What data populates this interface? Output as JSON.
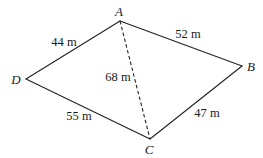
{
  "diagram": {
    "type": "quadrilateral",
    "vertices": [
      {
        "id": "A",
        "label": "A",
        "x": 120,
        "y": 21,
        "label_x": 119,
        "label_y": 16
      },
      {
        "id": "B",
        "label": "B",
        "x": 242,
        "y": 66,
        "label_x": 251,
        "label_y": 71
      },
      {
        "id": "C",
        "label": "C",
        "x": 150,
        "y": 139,
        "label_x": 149,
        "label_y": 154
      },
      {
        "id": "D",
        "label": "D",
        "x": 26,
        "y": 79,
        "label_x": 16,
        "label_y": 84
      }
    ],
    "edges": [
      {
        "from": "D",
        "to": "A",
        "label": "44 m",
        "style": "solid",
        "label_x": 64,
        "label_y": 46
      },
      {
        "from": "A",
        "to": "B",
        "label": "52 m",
        "style": "solid",
        "label_x": 188,
        "label_y": 38
      },
      {
        "from": "B",
        "to": "C",
        "label": "47 m",
        "style": "solid",
        "label_x": 207,
        "label_y": 117
      },
      {
        "from": "C",
        "to": "D",
        "label": "55 m",
        "style": "solid",
        "label_x": 79,
        "label_y": 120
      },
      {
        "from": "A",
        "to": "C",
        "label": "68 m",
        "style": "dashed",
        "label_x": 118,
        "label_y": 81
      }
    ],
    "colors": {
      "stroke": "#222222",
      "text": "#1a1a1a",
      "background": "#ffffff"
    }
  }
}
